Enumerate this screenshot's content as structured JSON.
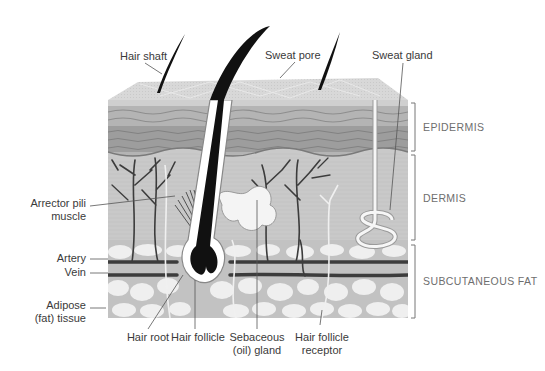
{
  "diagram": {
    "colors": {
      "background": "#ffffff",
      "top_surface": "#dcdcdc",
      "epidermis": "#a9a9a9",
      "epidermis_dark": "#8c8c8c",
      "dermis": "#c9c9c9",
      "subcutaneous": "#c6c6c6",
      "fat_cells": "#efefef",
      "vessel": "#3c3c3c",
      "hair": "#111111",
      "label_text": "#3a3a3a",
      "layer_text": "#6e6e6e"
    },
    "labels": {
      "hair_shaft": "Hair shaft",
      "sweat_pore": "Sweat pore",
      "sweat_gland": "Sweat gland",
      "arrector_pili_1": "Arrector pili",
      "arrector_pili_2": "muscle",
      "artery": "Artery",
      "vein": "Vein",
      "adipose_1": "Adipose",
      "adipose_2": "(fat) tissue",
      "hair_root": "Hair root",
      "hair_follicle": "Hair follicle",
      "sebaceous_1": "Sebaceous",
      "sebaceous_2": "(oil) gland",
      "receptor_1": "Hair follicle",
      "receptor_2": "receptor"
    },
    "layers": {
      "epidermis": "EPIDERMIS",
      "dermis": "DERMIS",
      "subcutaneous": "SUBCUTANEOUS FAT"
    }
  }
}
